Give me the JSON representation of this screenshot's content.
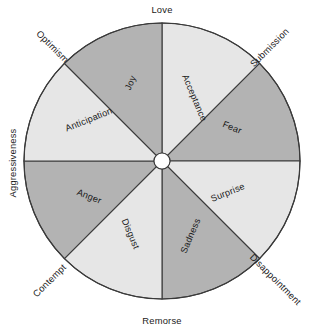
{
  "figure": {
    "name": "plutchik-wheel-of-emotions",
    "background_color": "#ffffff",
    "outline_color": "#3a3a3a",
    "dark_sector_color": "#b3b3b3",
    "light_sector_color": "#e6e6e6",
    "hub_color": "#ffffff",
    "center_x": 162,
    "center_y": 161,
    "radius": 138,
    "hub_radius": 8
  },
  "chart_data": {
    "type": "pie",
    "title": "",
    "legend": "none",
    "grid": false,
    "categories": [
      "Acceptance",
      "Fear",
      "Surprise",
      "Sadness",
      "Disgust",
      "Anger",
      "Anticipation",
      "Joy"
    ],
    "values": [
      45,
      45,
      45,
      45,
      45,
      45,
      45,
      45
    ],
    "slice_colors": [
      "#e6e6e6",
      "#b3b3b3",
      "#e6e6e6",
      "#b3b3b3",
      "#e6e6e6",
      "#b3b3b3",
      "#e6e6e6",
      "#b3b3b3"
    ],
    "boundary_labels": [
      "Love",
      "Submission",
      "Disappointment",
      "Remorse",
      "Contempt",
      "Aggressiveness",
      "Optimism"
    ]
  },
  "sectors": [
    {
      "id": "acceptance",
      "label": "Acceptance",
      "shade": "light",
      "start_angle_deg": -90,
      "end_angle_deg": -45,
      "label_x": 194,
      "label_y": 98,
      "label_rotation_deg": 67
    },
    {
      "id": "fear",
      "label": "Fear",
      "shade": "dark",
      "start_angle_deg": -45,
      "end_angle_deg": 0,
      "label_x": 232,
      "label_y": 128,
      "label_rotation_deg": 22
    },
    {
      "id": "surprise",
      "label": "Surprise",
      "shade": "light",
      "start_angle_deg": 0,
      "end_angle_deg": 45,
      "label_x": 228,
      "label_y": 193,
      "label_rotation_deg": -22
    },
    {
      "id": "sadness",
      "label": "Sadness",
      "shade": "dark",
      "start_angle_deg": 45,
      "end_angle_deg": 90,
      "label_x": 191,
      "label_y": 236,
      "label_rotation_deg": -67
    },
    {
      "id": "disgust",
      "label": "Disgust",
      "shade": "light",
      "start_angle_deg": 90,
      "end_angle_deg": 135,
      "label_x": 130,
      "label_y": 234,
      "label_rotation_deg": 67
    },
    {
      "id": "anger",
      "label": "Anger",
      "shade": "dark",
      "start_angle_deg": 135,
      "end_angle_deg": 180,
      "label_x": 89,
      "label_y": 197,
      "label_rotation_deg": 22
    },
    {
      "id": "anticipation",
      "label": "Anticipation",
      "shade": "light",
      "start_angle_deg": 180,
      "end_angle_deg": 225,
      "label_x": 89,
      "label_y": 120,
      "label_rotation_deg": -22
    },
    {
      "id": "joy",
      "label": "Joy",
      "shade": "dark",
      "start_angle_deg": 225,
      "end_angle_deg": 270,
      "label_x": 131,
      "label_y": 83,
      "label_rotation_deg": -67
    }
  ],
  "dyads": [
    {
      "id": "love",
      "label": "Love",
      "x": 162,
      "y": 11,
      "rotation_deg": 0,
      "anchor": "middle"
    },
    {
      "id": "submission",
      "label": "Submission",
      "x": 270,
      "y": 48,
      "rotation_deg": -45,
      "anchor": "middle"
    },
    {
      "id": "disappointment",
      "label": "Disappointment",
      "x": 275,
      "y": 280,
      "rotation_deg": 45,
      "anchor": "middle"
    },
    {
      "id": "remorse",
      "label": "Remorse",
      "x": 162,
      "y": 322,
      "rotation_deg": 0,
      "anchor": "middle"
    },
    {
      "id": "contempt",
      "label": "Contempt",
      "x": 50,
      "y": 281,
      "rotation_deg": -45,
      "anchor": "middle"
    },
    {
      "id": "aggressiveness",
      "label": "Aggressiveness",
      "x": 14,
      "y": 163,
      "rotation_deg": -90,
      "anchor": "middle"
    },
    {
      "id": "optimism",
      "label": "Optimism",
      "x": 52,
      "y": 47,
      "rotation_deg": 45,
      "anchor": "middle"
    }
  ]
}
